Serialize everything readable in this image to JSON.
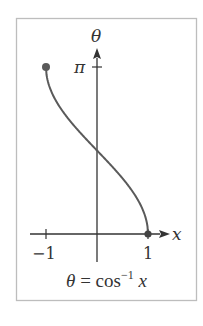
{
  "chart_data": {
    "type": "line",
    "function": "arccos",
    "xlabel": "x",
    "ylabel": "θ",
    "xlim": [
      -1,
      1
    ],
    "ylim": [
      0,
      3.14159
    ],
    "x_ticks": [
      {
        "value": -1,
        "label": "−1"
      },
      {
        "value": 1,
        "label": "1"
      }
    ],
    "y_ticks": [
      {
        "value": 3.14159,
        "label": "π"
      }
    ],
    "grid": false,
    "legend": null,
    "endpoints": [
      {
        "x": -1,
        "y": 3.14159,
        "marker": "filled-circle"
      },
      {
        "x": 1,
        "y": 0,
        "marker": "filled-circle"
      }
    ],
    "series": [
      {
        "name": "θ = cos⁻¹ x",
        "x": [
          -1,
          -0.9,
          -0.75,
          -0.5,
          -0.25,
          0,
          0.25,
          0.5,
          0.75,
          0.9,
          1
        ],
        "y": [
          3.1416,
          2.6906,
          2.4189,
          2.0944,
          1.8235,
          1.5708,
          1.3181,
          1.0472,
          0.7227,
          0.451,
          0
        ]
      }
    ],
    "colors": {
      "curve": "#5a5a5a",
      "axes": "#333333",
      "frame": "#bdbdbd",
      "text": "#333333"
    }
  },
  "labels": {
    "x_axis": "x",
    "y_axis": "θ",
    "tick_neg1": "−1",
    "tick_pos1": "1",
    "tick_pi": "π",
    "caption_lhs": "θ",
    "caption_eq": " = cos",
    "caption_sup": "−1",
    "caption_var": " x"
  }
}
